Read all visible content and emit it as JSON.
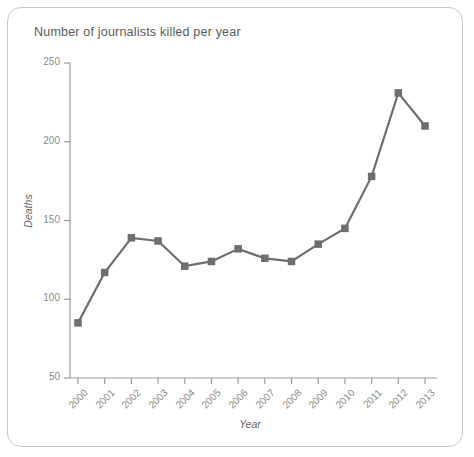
{
  "chart_data": {
    "type": "line",
    "title": "Number of journalists killed per year",
    "xlabel": "Year",
    "ylabel": "Deaths",
    "categories": [
      "2000",
      "2001",
      "2002",
      "2003",
      "2004",
      "2005",
      "2006",
      "2007",
      "2008",
      "2009",
      "2010",
      "2011",
      "2012",
      "2013"
    ],
    "values": [
      85,
      117,
      139,
      137,
      121,
      124,
      132,
      126,
      124,
      135,
      145,
      178,
      231,
      210
    ],
    "ylim": [
      50,
      250
    ],
    "yticks": [
      50,
      100,
      150,
      200,
      250
    ],
    "ytick_labels": [
      "50",
      "100",
      "150",
      "200",
      "250"
    ],
    "grid": false,
    "legend": false,
    "line_color": "#6e6e6e",
    "marker": "square",
    "marker_color": "#6e6e6e",
    "axis_color": "#9a9a9a",
    "text_color": "#8c8c8c",
    "background": "#ffffff"
  },
  "frame": {
    "border_color": "#c9c9c9"
  }
}
